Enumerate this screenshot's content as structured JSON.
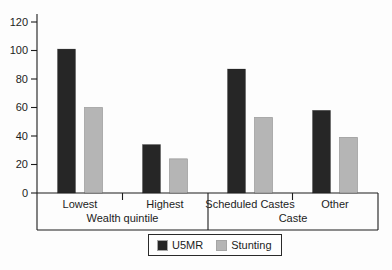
{
  "chart_data": {
    "type": "bar",
    "categories": [
      "Lowest",
      "Highest",
      "Scheduled Castes",
      "Other"
    ],
    "category_groups": [
      {
        "label": "Wealth quintile",
        "categories": [
          "Lowest",
          "Highest"
        ]
      },
      {
        "label": "Caste",
        "categories": [
          "Scheduled Castes",
          "Other"
        ]
      }
    ],
    "series": [
      {
        "name": "U5MR",
        "color": "#262626",
        "values": [
          101,
          34,
          87,
          58
        ]
      },
      {
        "name": "Stunting",
        "color": "#b5b5b5",
        "values": [
          60,
          24,
          53,
          39
        ]
      }
    ],
    "y_axis": {
      "min": 0,
      "max": 120,
      "tick_step": 20,
      "ticks": [
        0,
        20,
        40,
        60,
        80,
        100,
        120
      ]
    },
    "legend": {
      "position": "bottom",
      "entries": [
        "U5MR",
        "Stunting"
      ]
    },
    "grid": false,
    "axis_color": "#1c1c1c",
    "background_color": "#fdfdfd"
  }
}
